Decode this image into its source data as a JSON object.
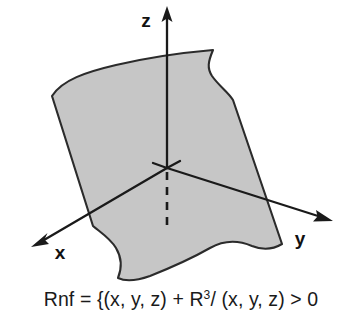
{
  "figure": {
    "name": "three-dimensional-coordinate-axes-with-shaded-surface",
    "background_color": "#ffffff",
    "stroke_color": "#1a1a1a",
    "surface_fill_color": "#c6c6c6",
    "surface_stroke_color": "#2b2b2b"
  },
  "axes": [
    {
      "id": "z",
      "label": "z",
      "direction": "up",
      "arrow": true,
      "dashed_negative_segment": true
    },
    {
      "id": "x",
      "label": "x",
      "direction": "down-left",
      "arrow": true,
      "dashed_negative_segment": false
    },
    {
      "id": "y",
      "label": "y",
      "direction": "down-right",
      "arrow": true,
      "dashed_negative_segment": false
    }
  ],
  "caption": {
    "full_text": "Rnf = {(x, y, z) + R3/ (x, y, z) > 0",
    "part_1": "Rnf = {(x, y, z) + R",
    "exponent": "3",
    "part_2": "/ (x, y, z) > 0"
  }
}
